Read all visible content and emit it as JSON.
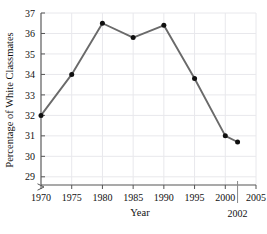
{
  "chart_data": {
    "type": "line",
    "title": "",
    "xlabel": "Year",
    "ylabel": "Percentage of White Classmates",
    "x": [
      1970,
      1975,
      1980,
      1985,
      1990,
      1995,
      2000,
      2002
    ],
    "values": [
      32.0,
      34.0,
      36.5,
      35.8,
      36.4,
      33.8,
      31.0,
      30.7
    ],
    "series": [
      {
        "name": "Percentage of White Classmates",
        "values": [
          32.0,
          34.0,
          36.5,
          35.8,
          36.4,
          33.8,
          31.0,
          30.7
        ]
      }
    ],
    "xlim": [
      1970,
      2005
    ],
    "ylim": [
      28.6,
      37
    ],
    "xticks": [
      1970,
      1975,
      1980,
      1985,
      1990,
      1995,
      2000,
      2005
    ],
    "xtick_labels": [
      "1970",
      "1975",
      "1980",
      "1985",
      "1990",
      "1995",
      "2000",
      "2005"
    ],
    "yticks": [
      29,
      30,
      31,
      32,
      33,
      34,
      35,
      36,
      37
    ],
    "ytick_labels": [
      "29",
      "30",
      "31",
      "32",
      "33",
      "34",
      "35",
      "36",
      "37"
    ],
    "grid": true,
    "legend": "none",
    "y_axis_break": true,
    "annotations": [
      {
        "label": "2002",
        "x": 2002,
        "type": "vertical-marker-line"
      }
    ],
    "colors": {
      "line": "#6a6a6a",
      "marker": "#101010",
      "grid": "#e8e8ec",
      "axis": "#555555",
      "text": "#111111",
      "background": "#ffffff"
    }
  }
}
